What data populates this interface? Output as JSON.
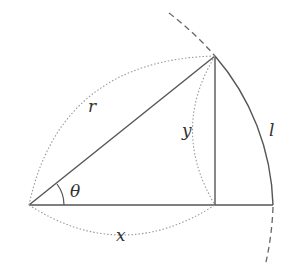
{
  "diagram": {
    "labels": {
      "radius": "r",
      "horizontal": "x",
      "vertical": "y",
      "arc": "l",
      "angle": "θ"
    },
    "points": {
      "origin": [
        29,
        205
      ],
      "top": [
        215,
        56
      ],
      "foot": [
        215,
        205
      ],
      "arc_end": [
        273,
        205
      ]
    },
    "colors": {
      "line": "#555555",
      "dotted": "#999999",
      "dashed": "#666666"
    }
  }
}
